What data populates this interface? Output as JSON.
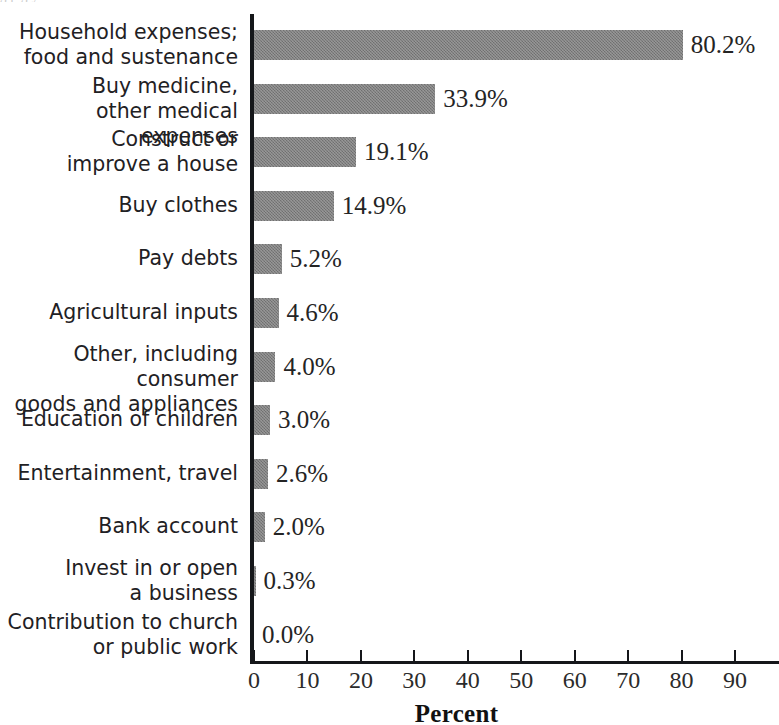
{
  "figure": {
    "caption_remnant": "g                                                      p      g   y",
    "axis_title": "Percent"
  },
  "chart_data": {
    "type": "bar",
    "orientation": "horizontal",
    "title": "",
    "xlabel": "Percent",
    "ylabel": "",
    "xlim": [
      0,
      90
    ],
    "xticks": [
      0,
      10,
      20,
      30,
      40,
      50,
      60,
      70,
      80,
      90
    ],
    "xtick_labels": [
      "0",
      "10",
      "20",
      "30",
      "40",
      "50",
      "60",
      "70",
      "80",
      "90"
    ],
    "grid": false,
    "legend": null,
    "bar_color": "#7d7d7d",
    "categories": [
      "Household expenses;\nfood and sustenance",
      "Buy medicine,\nother medical expenses",
      "Construct or\nimprove a house",
      "Buy clothes",
      "Pay debts",
      "Agricultural inputs",
      "Other, including consumer\ngoods and appliances",
      "Education of children",
      "Entertainment, travel",
      "Bank account",
      "Invest in or open\na business",
      "Contribution to church\nor public work"
    ],
    "values": [
      80.2,
      33.9,
      19.1,
      14.9,
      5.2,
      4.6,
      4.0,
      3.0,
      2.6,
      2.0,
      0.3,
      0.0
    ],
    "value_labels": [
      "80.2%",
      "33.9%",
      "19.1%",
      "14.9%",
      "5.2%",
      "4.6%",
      "4.0%",
      "3.0%",
      "2.6%",
      "2.0%",
      "0.3%",
      "0.0%"
    ]
  }
}
